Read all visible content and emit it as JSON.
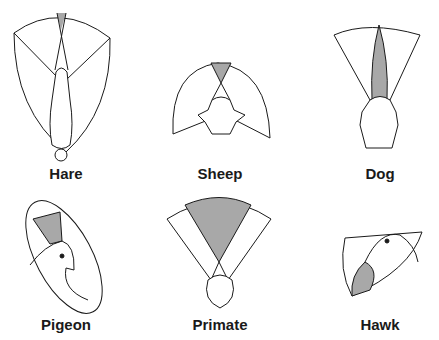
{
  "figure": {
    "colors": {
      "line": "#1a1a1a",
      "binocular_fill": "#a8a8a8",
      "background": "#ffffff"
    },
    "panels": [
      {
        "id": "hare",
        "label": "Hare"
      },
      {
        "id": "sheep",
        "label": "Sheep"
      },
      {
        "id": "dog",
        "label": "Dog"
      },
      {
        "id": "pigeon",
        "label": "Pigeon"
      },
      {
        "id": "primate",
        "label": "Primate"
      },
      {
        "id": "hawk",
        "label": "Hawk"
      }
    ]
  }
}
